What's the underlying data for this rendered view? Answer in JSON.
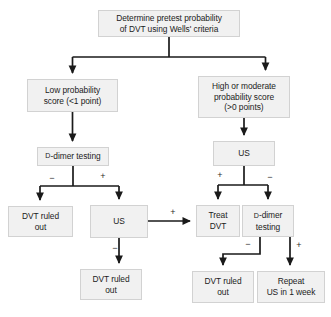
{
  "diagram": {
    "type": "flowchart",
    "colors": {
      "node_fill": "#f1f1f1",
      "node_border": "#d2d2d2",
      "edge": "#1a1a1a",
      "text": "#1c1c1c",
      "background": "#ffffff"
    },
    "nodes": [
      {
        "id": "pretest",
        "text": "Determine pretest probability\nof DVT using Wells' criteria",
        "x": 98,
        "y": 10,
        "w": 142,
        "h": 27
      },
      {
        "id": "low_prob",
        "text": "Low probability\nscore (<1 point)",
        "x": 27,
        "y": 79,
        "w": 91,
        "h": 33
      },
      {
        "id": "high_prob",
        "text": "High or moderate\nprobability score\n(>0 points)",
        "x": 198,
        "y": 76,
        "w": 92,
        "h": 42
      },
      {
        "id": "ddimer_left",
        "prefix": "D",
        "text": "-dimer testing",
        "x": 37,
        "y": 147,
        "w": 72,
        "h": 19
      },
      {
        "id": "us_right",
        "text": "US",
        "x": 213,
        "y": 141,
        "w": 62,
        "h": 25
      },
      {
        "id": "ruled_out_1",
        "text": "DVT ruled\nout",
        "x": 8,
        "y": 206,
        "w": 65,
        "h": 31
      },
      {
        "id": "us_middle",
        "text": "US",
        "x": 90,
        "y": 205,
        "w": 58,
        "h": 33
      },
      {
        "id": "treat_dvt",
        "text": "Treat\nDVT",
        "x": 196,
        "y": 205,
        "w": 44,
        "h": 32
      },
      {
        "id": "ddimer_right",
        "prefix": "D",
        "text": "-dimer\ntesting",
        "x": 242,
        "y": 205,
        "w": 52,
        "h": 32
      },
      {
        "id": "ruled_out_2",
        "text": "DVT ruled\nout",
        "x": 80,
        "y": 269,
        "w": 62,
        "h": 31
      },
      {
        "id": "ruled_out_3",
        "text": "DVT ruled\nout",
        "x": 192,
        "y": 271,
        "w": 62,
        "h": 32
      },
      {
        "id": "repeat_us",
        "text": "Repeat\nUS in 1 week",
        "x": 257,
        "y": 271,
        "w": 68,
        "h": 32
      }
    ],
    "edge_labels": [
      {
        "id": "ddimer-left-neg",
        "text": "−",
        "x": 47,
        "y": 174
      },
      {
        "id": "ddimer-left-pos",
        "text": "+",
        "x": 98,
        "y": 172
      },
      {
        "id": "us-right-pos",
        "text": "+",
        "x": 215,
        "y": 171
      },
      {
        "id": "us-right-neg",
        "text": "−",
        "x": 265,
        "y": 173
      },
      {
        "id": "us-middle-to-treat-pos",
        "text": "+",
        "x": 168,
        "y": 208
      },
      {
        "id": "us-middle-neg",
        "text": "−",
        "x": 110,
        "y": 244
      },
      {
        "id": "ddimer-right-neg",
        "text": "−",
        "x": 243,
        "y": 240
      },
      {
        "id": "ddimer-right-pos",
        "text": "+",
        "x": 294,
        "y": 241
      }
    ]
  }
}
